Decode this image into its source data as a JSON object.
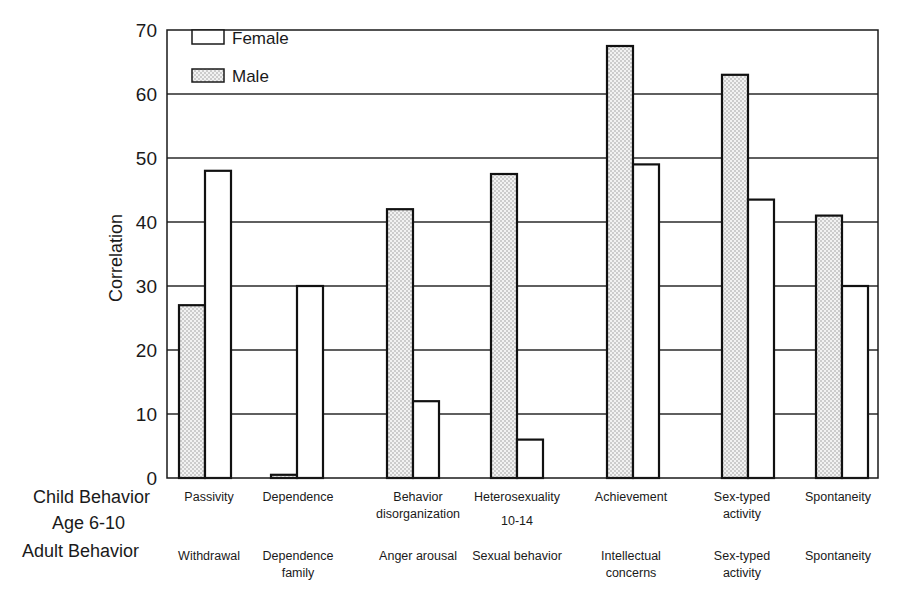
{
  "chart_data": {
    "type": "bar",
    "title": "",
    "xlabel": "",
    "ylabel": "Correlation",
    "ylim": [
      0,
      70
    ],
    "yticks": [
      0,
      10,
      20,
      30,
      40,
      50,
      60,
      70
    ],
    "grid": true,
    "legend_position": "top-left (inside plot)",
    "legend": [
      {
        "name": "Female",
        "style": "white"
      },
      {
        "name": "Male",
        "style": "dotted"
      }
    ],
    "row_labels": {
      "child": "Child Behavior",
      "age": "Age 6-10",
      "adult": "Adult Behavior"
    },
    "categories": [
      {
        "child": "Passivity",
        "age": "",
        "adult": "Withdrawal"
      },
      {
        "child": "Dependence",
        "age": "",
        "adult": "Dependence\nfamily"
      },
      {
        "child": "Behavior\ndisorganization",
        "age": "",
        "adult": "Anger arousal"
      },
      {
        "child": "Heterosexuality",
        "age": "10-14",
        "adult": "Sexual behavior"
      },
      {
        "child": "Achievement",
        "age": "",
        "adult": "Intellectual\nconcerns"
      },
      {
        "child": "Sex-typed\nactivity",
        "age": "",
        "adult": "Sex-typed\nactivity"
      },
      {
        "child": "Spontaneity",
        "age": "",
        "adult": "Spontaneity"
      }
    ],
    "series": [
      {
        "name": "Male",
        "values": [
          27,
          0.5,
          42,
          47.5,
          67.5,
          63,
          41
        ]
      },
      {
        "name": "Female",
        "values": [
          48,
          30,
          12,
          6,
          49,
          43.5,
          30
        ]
      }
    ]
  },
  "legend": {
    "female_label": "Female",
    "male_label": "Male"
  },
  "axis": {
    "ylabel": "Correlation"
  },
  "rows": {
    "child": "Child Behavior",
    "age": "Age 6-10",
    "adult": "Adult Behavior"
  }
}
